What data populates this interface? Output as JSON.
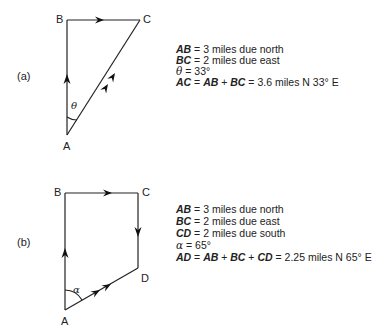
{
  "panel_a": {
    "tag": "(a)",
    "points": {
      "A": "A",
      "B": "B",
      "C": "C"
    },
    "angle_symbol": "θ",
    "lines": [
      {
        "lhs": "AB",
        "rhs": " = 3 miles due north"
      },
      {
        "lhs": "BC",
        "rhs": " = 2 miles due east"
      },
      {
        "sym": "θ",
        "rhs": " = 33°"
      },
      {
        "lhs": "AC",
        "mid1": " = ",
        "v1": "AB",
        "mid2": " + ",
        "v2": "BC",
        "rhs": " = 3.6 miles N 33° E"
      }
    ]
  },
  "panel_b": {
    "tag": "(b)",
    "points": {
      "A": "A",
      "B": "B",
      "C": "C",
      "D": "D"
    },
    "angle_symbol": "α",
    "lines": [
      {
        "lhs": "AB",
        "rhs": " = 3 miles due north"
      },
      {
        "lhs": "BC",
        "rhs": " = 2 miles due east"
      },
      {
        "lhs": "CD",
        "rhs": " = 2 miles due south"
      },
      {
        "sym": "α",
        "rhs": " = 65°"
      },
      {
        "lhs": "AD",
        "mid1": " = ",
        "v1": "AB",
        "mid2": " + ",
        "v2": "BC",
        "mid3": " + ",
        "v3": "CD",
        "rhs": " = 2.25 miles N 65° E"
      }
    ]
  }
}
